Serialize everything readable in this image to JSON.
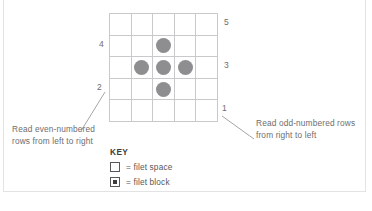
{
  "figure": {
    "type": "filet-crochet-chart",
    "grid": {
      "rows": 5,
      "columns": 5,
      "cell_states": [
        [
          "space",
          "space",
          "space",
          "space",
          "space"
        ],
        [
          "space",
          "space",
          "block",
          "space",
          "space"
        ],
        [
          "space",
          "block",
          "block",
          "block",
          "space"
        ],
        [
          "space",
          "space",
          "block",
          "space",
          "space"
        ],
        [
          "space",
          "space",
          "space",
          "space",
          "space"
        ]
      ]
    },
    "row_labels": {
      "right": [
        {
          "id": "label-5",
          "text": "5",
          "row": 1
        },
        {
          "id": "label-3",
          "text": "3",
          "row": 3
        },
        {
          "id": "label-1",
          "text": "1",
          "row": 5
        }
      ],
      "left": [
        {
          "id": "label-4",
          "text": "4",
          "row": 2
        },
        {
          "id": "label-2",
          "text": "2",
          "row": 4
        }
      ]
    },
    "notes": {
      "left": "Read even-numbered rows from left to right",
      "right": "Read odd-numbered rows from right to left"
    },
    "key": {
      "title": "KEY",
      "items": [
        {
          "swatch": "empty-square",
          "label": "= filet space"
        },
        {
          "swatch": "dotted-square",
          "label": "= filet block"
        }
      ]
    },
    "colors": {
      "grid_line": "#c9c9cb",
      "block_fill": "#8e8e90",
      "text": "#58585a",
      "frame": "#e3e3e4"
    }
  }
}
